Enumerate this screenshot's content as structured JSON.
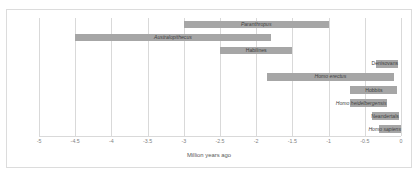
{
  "chart_data": {
    "type": "bar",
    "orientation": "horizontal",
    "subtype": "range",
    "title": "",
    "xlabel": "Million years ago",
    "ylabel": "",
    "xlim": [
      -5,
      0
    ],
    "xticks": [
      "-5",
      "-4.5",
      "-4",
      "-3.5",
      "-3",
      "-2.5",
      "-2",
      "-1.5",
      "-1",
      "-0.5",
      "0"
    ],
    "xtick_values": [
      -5,
      -4.5,
      -4,
      -3.5,
      -3,
      -2.5,
      -2,
      -1.5,
      -1,
      -0.5,
      0
    ],
    "grid": "vertical",
    "legend": "none",
    "bar_color": "#a6a6a6",
    "categories": [
      "Paranthropus",
      "Australopithecus",
      "Habilines",
      "Denisovans",
      "Homo erectus",
      "Hobbits",
      "Homo heidelbergensis",
      "Neandertals",
      "Homo sapiens"
    ],
    "bars": [
      {
        "label": "Paranthropus",
        "start": -3.0,
        "end": -1.0,
        "italic": true,
        "label_align": "center"
      },
      {
        "label": "Australopithecus",
        "start": -4.5,
        "end": -1.8,
        "italic": true,
        "label_align": "center"
      },
      {
        "label": "Habilines",
        "start": -2.5,
        "end": -1.5,
        "italic": false,
        "label_align": "center"
      },
      {
        "label": "Denisovans",
        "start": -0.35,
        "end": -0.04,
        "italic": false,
        "label_align": "left-outside"
      },
      {
        "label": "Homo erectus",
        "start": -1.85,
        "end": -0.1,
        "italic": true,
        "label_align": "center"
      },
      {
        "label": "Hobbits",
        "start": -0.7,
        "end": -0.05,
        "italic": false,
        "label_align": "center"
      },
      {
        "label": "Homo heidelbergensis",
        "start": -0.7,
        "end": -0.2,
        "italic": true,
        "label_align": "left-outside"
      },
      {
        "label": "Neandertals",
        "start": -0.4,
        "end": -0.03,
        "italic": false,
        "label_align": "left-outside"
      },
      {
        "label": "Homo sapiens",
        "start": -0.3,
        "end": 0.0,
        "italic": true,
        "label_align": "left-outside"
      }
    ]
  }
}
